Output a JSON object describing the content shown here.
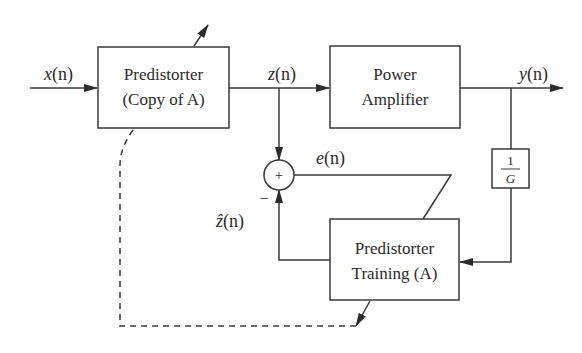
{
  "diagram": {
    "type": "block-diagram",
    "blocks": {
      "predistorter": {
        "line1": "Predistorter",
        "line2": "(Copy of A)"
      },
      "power_amplifier": {
        "line1": "Power",
        "line2": "Amplifier"
      },
      "training": {
        "line1": "Predistorter",
        "line2": "Training (A)"
      },
      "gain": {
        "num": "1",
        "den": "G"
      },
      "summer": {
        "symbol": "+",
        "neg_sign": "−"
      }
    },
    "signals": {
      "input": "x(n)",
      "pd_output": "z(n)",
      "output": "y(n)",
      "error": "e(n)",
      "estimate": "ẑ(n)"
    },
    "signal_parts": {
      "x": "x",
      "z": "z",
      "y": "y",
      "e": "e",
      "zhat": "ẑ",
      "arg": "(n)"
    },
    "edges": [
      {
        "from": "input",
        "to": "predistorter",
        "label": "x(n)"
      },
      {
        "from": "predistorter",
        "to": "power_amplifier",
        "label": "z(n)"
      },
      {
        "from": "predistorter",
        "to": "summer",
        "label": "z(n)",
        "sign": "+"
      },
      {
        "from": "power_amplifier",
        "to": "output",
        "label": "y(n)"
      },
      {
        "from": "power_amplifier",
        "to": "gain",
        "label": "y(n)"
      },
      {
        "from": "gain",
        "to": "training"
      },
      {
        "from": "training",
        "to": "summer",
        "label": "ẑ(n)",
        "sign": "−"
      },
      {
        "from": "summer",
        "to": "training",
        "label": "e(n)",
        "style": "adaptation"
      },
      {
        "from": "training",
        "to": "predistorter",
        "style": "dashed",
        "meaning": "coefficient copy"
      }
    ]
  }
}
